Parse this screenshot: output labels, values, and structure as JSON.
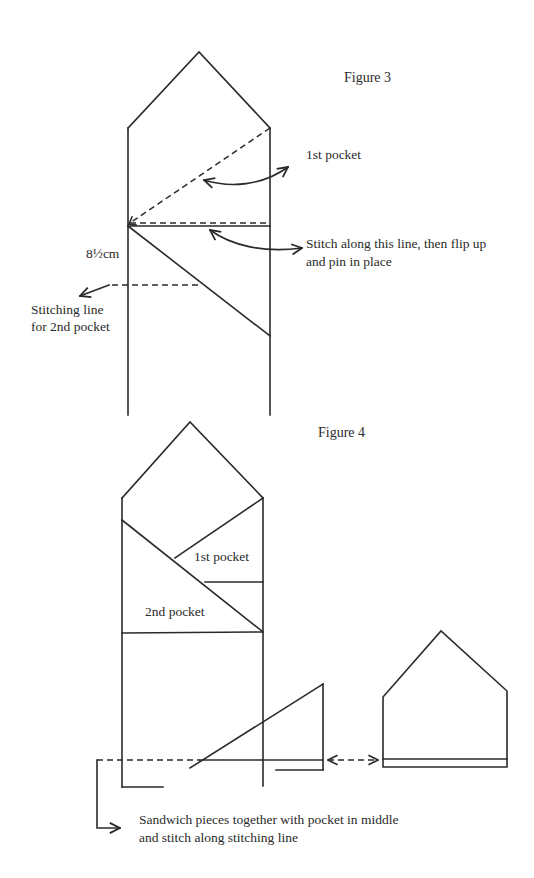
{
  "figure3": {
    "title": "Figure 3",
    "labels": {
      "first_pocket": "1st pocket",
      "stitch_line_1": "Stitch along this line, then flip up",
      "stitch_line_2": "and pin in place",
      "measurement": "8½cm",
      "stitching_line_1": "Stitching line",
      "stitching_line_2": "for 2nd pocket"
    }
  },
  "figure4": {
    "title": "Figure 4",
    "labels": {
      "first_pocket": "1st pocket",
      "second_pocket": "2nd pocket",
      "sandwich_1": "Sandwich pieces together with pocket in middle",
      "sandwich_2": "and stitch along stitching line"
    }
  },
  "colors": {
    "line": "#2a2a2a",
    "background": "#ffffff"
  }
}
